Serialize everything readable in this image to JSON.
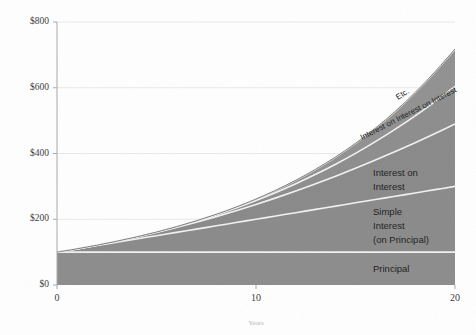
{
  "chart_data": {
    "type": "area",
    "title": "",
    "xlabel": "Years",
    "ylabel": "",
    "xlim": [
      0,
      20
    ],
    "ylim": [
      0,
      800
    ],
    "grid": true,
    "legend_position": "inline-annotations",
    "currency_prefix": "$",
    "principal": 100,
    "rate_percent": 10,
    "x_ticks": [
      {
        "value": 0,
        "label": "0"
      },
      {
        "value": 10,
        "label": "10"
      },
      {
        "value": 20,
        "label": "20"
      }
    ],
    "y_ticks": [
      {
        "value": 0,
        "label": "$0"
      },
      {
        "value": 200,
        "label": "$200"
      },
      {
        "value": 400,
        "label": "$400"
      },
      {
        "value": 600,
        "label": "$600"
      },
      {
        "value": 800,
        "label": "$800"
      }
    ],
    "x": [
      0,
      1,
      2,
      3,
      4,
      5,
      6,
      7,
      8,
      9,
      10,
      11,
      12,
      13,
      14,
      15,
      16,
      17,
      18,
      19,
      20
    ],
    "series": [
      {
        "name": "Principal",
        "label": "Principal",
        "color": "#8c8c8c",
        "values": [
          100,
          100,
          100,
          100,
          100,
          100,
          100,
          100,
          100,
          100,
          100,
          100,
          100,
          100,
          100,
          100,
          100,
          100,
          100,
          100,
          100
        ]
      },
      {
        "name": "Simple Interest (on Principal)",
        "label": "Simple\nInterest\n(on Principal)",
        "color": "#8a8a8a",
        "values": [
          0,
          10,
          20,
          30,
          40,
          50,
          60,
          70,
          80,
          90,
          100,
          110,
          120,
          130,
          140,
          150,
          160,
          170,
          180,
          190,
          200
        ]
      },
      {
        "name": "Interest on Interest",
        "label": "Interest on\nInterest",
        "color": "#898989",
        "values": [
          0,
          0,
          1,
          3,
          6,
          10,
          15,
          21,
          28,
          36,
          45,
          55,
          66,
          78,
          91,
          105,
          120,
          136,
          153,
          171,
          190
        ]
      },
      {
        "name": "Interest on Interest on Interest",
        "label": "Interest on Interest on Interest",
        "color": "#8d8d8d",
        "values": [
          0,
          0,
          0,
          0.1,
          0.4,
          1,
          2,
          3.5,
          5.6,
          8.4,
          12,
          16.5,
          22,
          28.6,
          36.4,
          45.5,
          56,
          68,
          81.6,
          96.9,
          114
        ]
      },
      {
        "name": "Etc.",
        "label": "Etc.",
        "color": "#919191",
        "values": [
          0,
          0,
          0,
          0,
          0,
          0.1,
          0.3,
          0.7,
          1.4,
          2.6,
          4.4,
          7,
          10.6,
          15.5,
          22,
          30.4,
          41,
          54.4,
          71,
          91,
          114
        ]
      }
    ],
    "totals": [
      100,
      110,
      121,
      133,
      146,
      161,
      177,
      195,
      214,
      236,
      259,
      285,
      314,
      345,
      380,
      418,
      459,
      505,
      556,
      611,
      672
    ]
  },
  "annotations": {
    "principal": "Principal",
    "simple_interest_line1": "Simple",
    "simple_interest_line2": "Interest",
    "simple_interest_line3": "(on Principal)",
    "interest_on_interest_line1": "Interest on",
    "interest_on_interest_line2": "Interest",
    "interest_on_interest_on_interest": "Interest on Interest on Interest",
    "etc": "Etc."
  }
}
